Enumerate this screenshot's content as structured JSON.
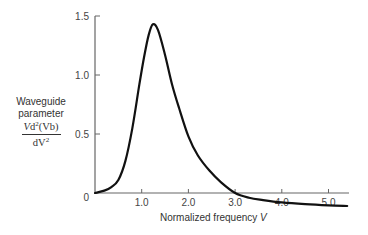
{
  "chart_data": {
    "type": "line",
    "title": "",
    "xlabel": "Normalized frequency V",
    "ylabel": "Waveguide parameter V d²(Vb) / dV²",
    "xlim": [
      0,
      5.45
    ],
    "ylim": [
      -0.12,
      1.5
    ],
    "x_ticks": [
      "1.0",
      "2.0",
      "3.0",
      "4.0",
      "5.0"
    ],
    "y_ticks": [
      "0",
      "0.5",
      "1.0",
      "1.5"
    ],
    "grid": false,
    "legend": null,
    "series": [
      {
        "name": "Vd2(Vb)/dV2",
        "x": [
          0.0,
          0.2,
          0.35,
          0.5,
          0.65,
          0.8,
          0.95,
          1.05,
          1.15,
          1.24,
          1.35,
          1.5,
          1.65,
          1.8,
          2.0,
          2.2,
          2.45,
          2.7,
          3.0,
          3.3,
          3.6,
          4.0,
          4.5,
          5.0,
          5.4
        ],
        "y": [
          0.0,
          0.02,
          0.05,
          0.11,
          0.27,
          0.55,
          0.92,
          1.15,
          1.34,
          1.43,
          1.38,
          1.17,
          0.92,
          0.72,
          0.48,
          0.32,
          0.19,
          0.09,
          0.0,
          -0.04,
          -0.06,
          -0.08,
          -0.095,
          -0.105,
          -0.11
        ]
      }
    ]
  },
  "labels": {
    "y_line1": "Waveguide",
    "y_line2": "parameter",
    "y_num_prefix": "V",
    "y_num_mid": "d",
    "y_num_sup": "2",
    "y_num_suffix": "(Vb)",
    "y_den_prefix": "dV",
    "y_den_sup": "2",
    "x_text": "Normalized frequency ",
    "x_var": "V"
  }
}
